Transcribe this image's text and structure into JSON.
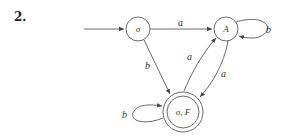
{
  "problem_number": "2.",
  "states": [
    {
      "id": "s0",
      "label": "σ",
      "start": true,
      "accepting": false
    },
    {
      "id": "sA",
      "label": "A",
      "start": false,
      "accepting": false
    },
    {
      "id": "sF",
      "label": "σ, F",
      "start": false,
      "accepting": true
    }
  ],
  "transitions": [
    {
      "from": "s0",
      "to": "sA",
      "symbol": "a"
    },
    {
      "from": "s0",
      "to": "sF",
      "symbol": "b"
    },
    {
      "from": "sA",
      "to": "sA",
      "symbol": "b"
    },
    {
      "from": "sA",
      "to": "sF",
      "symbol": "a"
    },
    {
      "from": "sF",
      "to": "sA",
      "symbol": "a"
    },
    {
      "from": "sF",
      "to": "sF",
      "symbol": "b"
    }
  ]
}
